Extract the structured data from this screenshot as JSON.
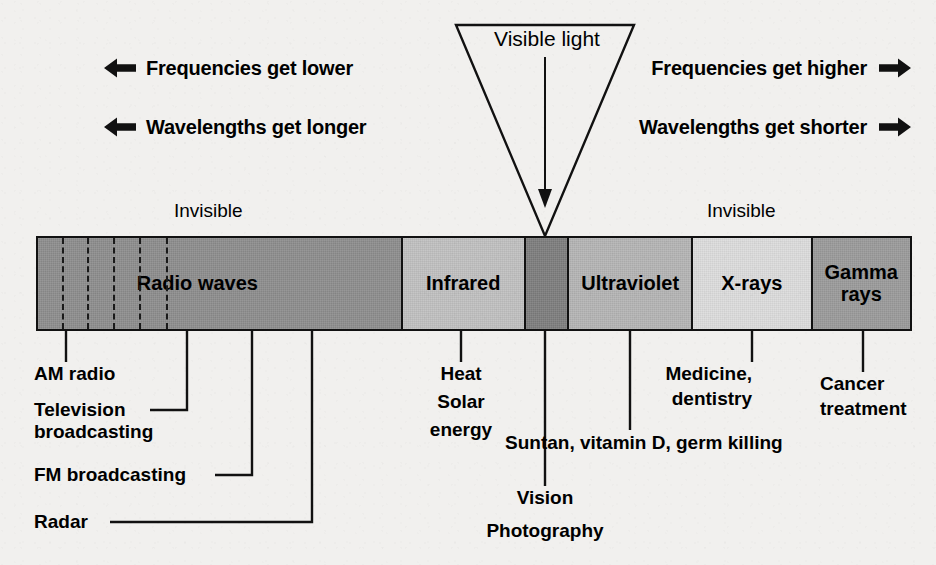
{
  "figure": {
    "background_color": "#f1f0ee",
    "ink_color": "#111111"
  },
  "directions": {
    "left": [
      {
        "label": "Frequencies get lower",
        "icon": "arrow-left-icon"
      },
      {
        "label": "Wavelengths get longer",
        "icon": "arrow-left-icon"
      }
    ],
    "right": [
      {
        "label": "Frequencies get higher",
        "icon": "arrow-right-icon"
      },
      {
        "label": "Wavelengths get shorter",
        "icon": "arrow-right-icon"
      }
    ]
  },
  "visible_light": {
    "label": "Visible light",
    "pointer_icon": "down-arrow-icon"
  },
  "invisible_labels": {
    "left": "Invisible",
    "right": "Invisible"
  },
  "chart_data": {
    "type": "bar",
    "orientation": "horizontal-band",
    "xlabel": "",
    "ylabel": "",
    "grid": false,
    "legend": "none",
    "categories": [
      "Radio waves",
      "Infrared",
      "Visible light",
      "Ultraviolet",
      "X-rays",
      "Gamma rays"
    ],
    "segments": [
      {
        "name": "Radio waves",
        "label": "Radio waves",
        "color": "#8d8d8d",
        "start_pct": 0.0,
        "end_pct": 41.6,
        "visible": false
      },
      {
        "name": "Infrared",
        "label": "Infrared",
        "color": "#c0c0c0",
        "start_pct": 41.6,
        "end_pct": 55.7,
        "visible": false
      },
      {
        "name": "Visible light",
        "label": "",
        "color": "#7d7d7d",
        "start_pct": 55.7,
        "end_pct": 60.7,
        "visible": true
      },
      {
        "name": "Ultraviolet",
        "label": "Ultraviolet",
        "color": "#b4b4b4",
        "start_pct": 60.7,
        "end_pct": 74.9,
        "visible": false
      },
      {
        "name": "X-rays",
        "label": "X-rays",
        "color": "#dcdcdc",
        "start_pct": 74.9,
        "end_pct": 88.6,
        "visible": false
      },
      {
        "name": "Gamma rays",
        "label": "Gamma\nrays",
        "color": "#9a9a9a",
        "start_pct": 88.6,
        "end_pct": 100.0,
        "visible": false
      }
    ],
    "radio_subdivisions_pct": [
      6.7,
      13.4,
      20.8,
      27.9,
      35.2
    ],
    "annotations": [
      {
        "text": "AM radio",
        "tick_pct": 3.4
      },
      {
        "text": "Television broadcasting",
        "tick_pct": 17.2
      },
      {
        "text": "FM broadcasting",
        "tick_pct": 24.7
      },
      {
        "text": "Radar",
        "tick_pct": 31.5
      },
      {
        "text": "Heat Solar energy",
        "tick_pct": 48.5
      },
      {
        "text": "Vision Photography",
        "tick_pct": 58.1
      },
      {
        "text": "Suntan, vitamin D, germ killing",
        "tick_pct": 67.8
      },
      {
        "text": "Medicine, dentistry",
        "tick_pct": 81.7
      },
      {
        "text": "Cancer treatment",
        "tick_pct": 94.4
      }
    ]
  },
  "callouts": {
    "am_radio": "AM radio",
    "television_line1": "Television",
    "television_line2": "broadcasting",
    "fm_broadcasting": "FM broadcasting",
    "radar": "Radar",
    "heat": "Heat",
    "solar": "Solar",
    "energy": "energy",
    "vision": "Vision",
    "photography": "Photography",
    "suntan": "Suntan, vitamin D, germ killing",
    "medicine": "Medicine,",
    "dentistry": "dentistry",
    "cancer": "Cancer",
    "treatment": "treatment"
  }
}
